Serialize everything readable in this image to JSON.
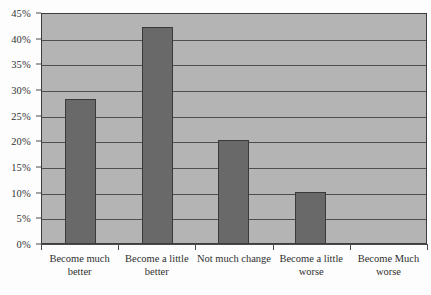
{
  "chart_data": {
    "type": "bar",
    "title": "",
    "subtitle": "",
    "xlabel": "",
    "ylabel": "",
    "categories": [
      "Become much better",
      "Become a little better",
      "Not much change",
      "Become a little worse",
      "Become Much worse"
    ],
    "values": [
      28,
      42,
      20,
      10,
      0
    ],
    "value_labels": [
      "28%",
      "42%",
      "20%",
      "10%",
      "0%"
    ],
    "ylim": [
      0,
      45
    ],
    "ytick_values": [
      0,
      5,
      10,
      15,
      20,
      25,
      30,
      35,
      40,
      45
    ],
    "ytick_labels": [
      "0%",
      "5%",
      "10%",
      "15%",
      "20%",
      "25%",
      "30%",
      "35%",
      "40%",
      "45%"
    ],
    "grid": true,
    "grid_axis": "y",
    "legend": false,
    "legend_position": "none",
    "series": [
      {
        "name": "",
        "values": [
          28,
          42,
          20,
          10,
          0
        ]
      }
    ],
    "colors": {
      "bar_fill": "#696969",
      "bar_edge": "#3a3a3a",
      "plot_background": "#b4b4b4",
      "gridline": "#4f4f4f",
      "axis_line": "#4a4a4a",
      "panel_border": "#3d3d3d",
      "text": "#2f2f2f",
      "figure_background": "#fdfdfd"
    }
  }
}
